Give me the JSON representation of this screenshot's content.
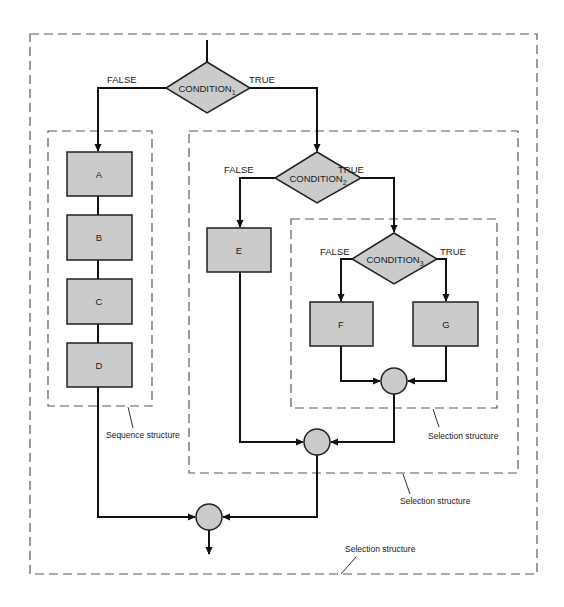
{
  "diagram": {
    "type": "flowchart",
    "colors": {
      "shape_fill": "#cbcbcb",
      "stroke": "#111111",
      "dashed_boundary": "#5a5a5a"
    },
    "decisions": [
      {
        "id": "condition1",
        "label": "CONDITION",
        "subscript": "1",
        "false_label": "FALSE",
        "true_label": "TRUE"
      },
      {
        "id": "condition2",
        "label": "CONDITION",
        "subscript": "2",
        "false_label": "FALSE",
        "true_label": "TRUE"
      },
      {
        "id": "condition3",
        "label": "CONDITION",
        "subscript": "3",
        "false_label": "FALSE",
        "true_label": "TRUE"
      }
    ],
    "processes": {
      "a": "A",
      "b": "B",
      "c": "C",
      "d": "D",
      "e": "E",
      "f": "F",
      "g": "G"
    },
    "structure_labels": {
      "sequence": "Sequence structure",
      "inner_selection": "Selection structure",
      "middle_selection": "Selection structure",
      "outer_selection": "Selection structure"
    }
  }
}
